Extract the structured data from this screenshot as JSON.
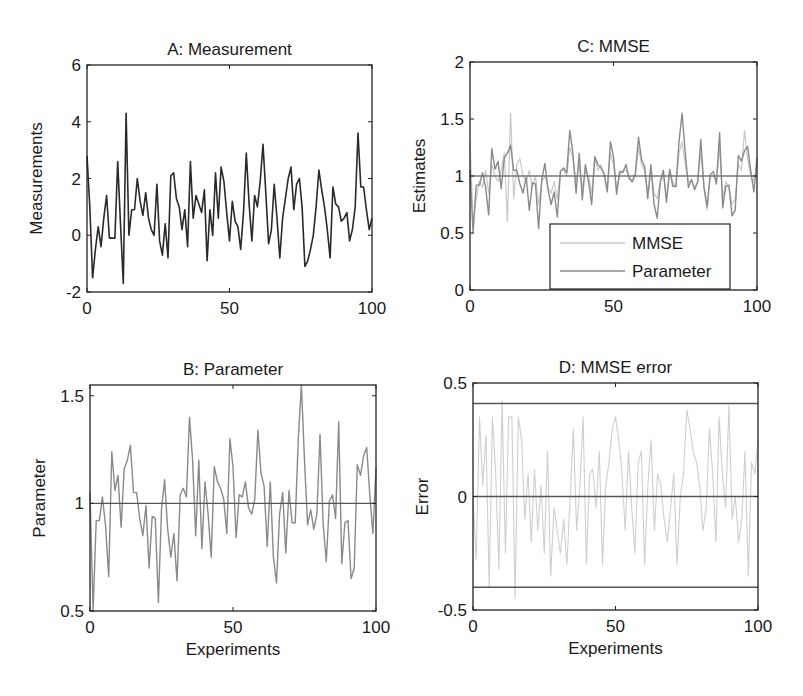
{
  "figure": {
    "panels": [
      "A",
      "B",
      "C",
      "D"
    ]
  },
  "chart_data": [
    {
      "id": "A",
      "type": "line",
      "title": "A: Measurement",
      "xlabel": "",
      "ylabel": "Measurements",
      "xlim": [
        0,
        100
      ],
      "ylim": [
        -2,
        6
      ],
      "xticks": [
        0,
        50,
        100
      ],
      "yticks": [
        -2,
        0,
        2,
        4,
        6
      ],
      "grid": false,
      "box": {
        "left": 87,
        "top": 65,
        "right": 372,
        "bottom": 292
      },
      "series": [
        {
          "name": "Measurement",
          "color": "#2a2a2a",
          "width": 1.6,
          "values": [
            2.8,
            1.0,
            -1.5,
            -0.5,
            0.3,
            -0.4,
            0.6,
            1.4,
            -0.1,
            -0.1,
            -0.1,
            2.6,
            0.4,
            -1.7,
            4.3,
            0.0,
            0.9,
            0.9,
            2.0,
            1.2,
            0.7,
            1.5,
            0.6,
            0.2,
            0.0,
            1.8,
            -0.2,
            -0.7,
            0.4,
            -0.8,
            2.1,
            2.2,
            1.3,
            1.0,
            0.2,
            0.9,
            -0.4,
            2.6,
            0.6,
            1.4,
            1.1,
            0.8,
            1.6,
            -0.9,
            0.9,
            0.0,
            2.2,
            0.6,
            2.4,
            1.9,
            0.8,
            -0.2,
            1.2,
            0.5,
            0.3,
            -0.5,
            0.8,
            2.9,
            1.1,
            -0.2,
            1.4,
            1.0,
            1.9,
            3.2,
            1.5,
            -0.3,
            0.2,
            1.8,
            0.6,
            -0.8,
            0.6,
            1.3,
            2.0,
            2.4,
            0.9,
            1.8,
            2.0,
            1.0,
            -1.1,
            -0.9,
            -0.5,
            0.0,
            1.0,
            2.3,
            1.6,
            1.0,
            0.2,
            -0.8,
            1.7,
            1.1,
            1.0,
            0.5,
            0.6,
            0.8,
            -0.2,
            0.2,
            1.0,
            3.6,
            1.7,
            1.7,
            0.9,
            0.2,
            0.6
          ]
        }
      ]
    },
    {
      "id": "B",
      "type": "line",
      "title": "B: Parameter",
      "xlabel": "Experiments",
      "ylabel": "Parameter",
      "xlim": [
        0,
        100
      ],
      "ylim": [
        0.5,
        1.55
      ],
      "xticks": [
        0,
        50,
        100
      ],
      "yticks": [
        0.5,
        1,
        1.5
      ],
      "grid": false,
      "box": {
        "left": 90,
        "top": 385,
        "right": 376,
        "bottom": 611
      },
      "reference_line": {
        "y": 1,
        "color": "#555555"
      },
      "series": [
        {
          "name": "Parameter",
          "color": "#8a8a8a",
          "width": 1.4,
          "values": [
            1.05,
            0.5,
            0.92,
            0.92,
            1.03,
            0.9,
            0.66,
            1.24,
            1.06,
            1.13,
            0.89,
            1.16,
            1.2,
            1.27,
            1.05,
            1.05,
            0.93,
            0.85,
            0.99,
            0.7,
            0.94,
            0.93,
            0.54,
            0.97,
            1.11,
            0.88,
            0.75,
            0.86,
            0.64,
            1.04,
            1.07,
            1.03,
            1.4,
            1.2,
            0.85,
            1.2,
            0.79,
            1.1,
            0.95,
            0.75,
            1.17,
            1.1,
            1.07,
            1.02,
            0.86,
            1.3,
            1.17,
            0.84,
            1.04,
            1.03,
            1.1,
            0.98,
            0.95,
            1.02,
            1.34,
            1.14,
            1.08,
            0.8,
            1.1,
            0.75,
            0.63,
            0.95,
            1.05,
            0.77,
            1.06,
            0.91,
            0.91,
            1.3,
            1.55,
            1.2,
            0.9,
            0.97,
            0.88,
            0.95,
            1.32,
            0.9,
            0.73,
            1.01,
            1.04,
            0.93,
            1.38,
            0.72,
            0.91,
            0.92,
            0.65,
            0.7,
            1.18,
            1.13,
            1.22,
            1.26,
            1.04,
            0.86,
            1.16
          ]
        }
      ]
    },
    {
      "id": "C",
      "type": "line",
      "title": "C: MMSE",
      "xlabel": "",
      "ylabel": "Estimates",
      "xlim": [
        0,
        100
      ],
      "ylim": [
        0,
        2
      ],
      "xticks": [
        0,
        50,
        100
      ],
      "yticks": [
        0,
        0.5,
        1,
        1.5,
        2
      ],
      "grid": false,
      "box": {
        "left": 470,
        "top": 62,
        "right": 757,
        "bottom": 290
      },
      "reference_line": {
        "y": 1,
        "color": "#777777"
      },
      "legend": {
        "position": "lower right",
        "entries": [
          {
            "label": "MMSE",
            "color": "#c8c8c8"
          },
          {
            "label": "Parameter",
            "color": "#8a8a8a"
          }
        ]
      },
      "series": [
        {
          "name": "MMSE",
          "color": "#c8c8c8",
          "width": 1.2,
          "values": [
            1.3,
            0.6,
            0.8,
            0.95,
            0.9,
            1.05,
            0.85,
            1.1,
            1.0,
            0.95,
            1.05,
            1.2,
            0.6,
            1.55,
            0.8,
            1.1,
            1.15,
            1.0,
            0.95,
            1.05,
            0.9,
            1.0,
            0.75,
            0.95,
            1.0,
            0.9,
            0.85,
            0.95,
            0.8,
            1.05,
            1.05,
            1.0,
            1.25,
            1.15,
            0.95,
            1.1,
            0.9,
            1.05,
            1.0,
            0.85,
            1.15,
            1.05,
            1.1,
            1.0,
            0.9,
            1.2,
            1.1,
            0.9,
            1.0,
            1.05,
            1.05,
            1.0,
            0.95,
            1.0,
            1.25,
            1.1,
            1.05,
            0.85,
            1.05,
            0.85,
            0.8,
            0.95,
            1.0,
            0.8,
            1.05,
            0.95,
            0.9,
            1.2,
            1.3,
            1.1,
            0.95,
            0.95,
            0.9,
            0.95,
            1.2,
            0.9,
            0.7,
            1.0,
            1.0,
            0.95,
            1.25,
            0.8,
            0.95,
            0.9,
            0.75,
            0.8,
            1.1,
            1.05,
            1.4,
            1.15,
            1.0,
            0.95,
            1.1
          ]
        },
        {
          "name": "Parameter",
          "color": "#8a8a8a",
          "width": 1.4,
          "values": [
            1.05,
            0.5,
            0.92,
            0.92,
            1.03,
            0.9,
            0.66,
            1.24,
            1.06,
            1.13,
            0.89,
            1.16,
            1.2,
            1.27,
            1.05,
            1.05,
            0.93,
            0.85,
            0.99,
            0.7,
            0.94,
            0.93,
            0.54,
            0.97,
            1.11,
            0.88,
            0.75,
            0.86,
            0.64,
            1.04,
            1.07,
            1.03,
            1.4,
            1.2,
            0.85,
            1.2,
            0.79,
            1.1,
            0.95,
            0.75,
            1.17,
            1.1,
            1.07,
            1.02,
            0.86,
            1.3,
            1.17,
            0.84,
            1.04,
            1.03,
            1.1,
            0.98,
            0.95,
            1.02,
            1.34,
            1.14,
            1.08,
            0.8,
            1.1,
            0.75,
            0.63,
            0.95,
            1.05,
            0.77,
            1.06,
            0.91,
            0.91,
            1.3,
            1.55,
            1.2,
            0.9,
            0.97,
            0.88,
            0.95,
            1.32,
            0.9,
            0.73,
            1.01,
            1.04,
            0.93,
            1.38,
            0.72,
            0.91,
            0.92,
            0.65,
            0.7,
            1.18,
            1.13,
            1.22,
            1.26,
            1.04,
            0.86,
            1.16
          ]
        }
      ]
    },
    {
      "id": "D",
      "type": "line",
      "title": "D: MMSE error",
      "xlabel": "Experiments",
      "ylabel": "Error",
      "xlim": [
        0,
        100
      ],
      "ylim": [
        -0.5,
        0.5
      ],
      "xticks": [
        0,
        50,
        100
      ],
      "yticks": [
        -0.5,
        0,
        0.5
      ],
      "grid": false,
      "box": {
        "left": 473,
        "top": 383,
        "right": 758,
        "bottom": 610
      },
      "reference_lines": [
        {
          "y": 0.41,
          "color": "#555555"
        },
        {
          "y": 0,
          "color": "#555555"
        },
        {
          "y": -0.4,
          "color": "#555555"
        }
      ],
      "series": [
        {
          "name": "MMSE error",
          "color": "#cfcfcf",
          "width": 1.1,
          "values": [
            0.0,
            -0.28,
            0.35,
            0.05,
            0.27,
            -0.4,
            0.35,
            0.1,
            -0.32,
            0.42,
            -0.25,
            0.35,
            0.35,
            -0.45,
            0.35,
            0.25,
            -0.1,
            0.1,
            -0.2,
            0.12,
            -0.15,
            0.05,
            -0.25,
            0.2,
            -0.35,
            -0.05,
            -0.15,
            -0.25,
            -0.1,
            -0.3,
            0.0,
            0.3,
            -0.15,
            0.05,
            0.35,
            -0.3,
            0.1,
            0.12,
            -0.05,
            0.2,
            -0.3,
            0.05,
            0.15,
            0.3,
            0.35,
            0.25,
            0.1,
            -0.15,
            0.2,
            -0.05,
            -0.25,
            0.15,
            0.2,
            -0.3,
            0.05,
            0.25,
            -0.15,
            0.1,
            0.05,
            -0.1,
            -0.2,
            -0.05,
            0.1,
            -0.3,
            0.0,
            0.1,
            0.38,
            0.3,
            0.2,
            0.15,
            0.05,
            -0.15,
            -0.05,
            0.3,
            0.1,
            -0.2,
            0.35,
            0.1,
            -0.05,
            0.4,
            -0.1,
            0.0,
            -0.2,
            -0.1,
            0.2,
            -0.35,
            0.15,
            0.1,
            0.25
          ]
        }
      ]
    }
  ]
}
